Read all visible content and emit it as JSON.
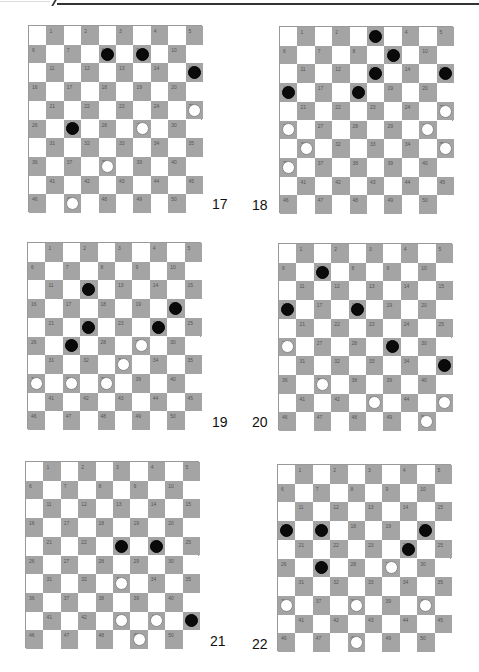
{
  "page": {
    "header_rule": true
  },
  "colors": {
    "dark_square": "#a4a4a4",
    "light_square": "#ffffff",
    "black_piece": "#0a0a0a",
    "white_piece": "#ffffff"
  },
  "boards": [
    {
      "id": "17",
      "label": "17",
      "x": 28,
      "y": 25,
      "label_x": 212,
      "label_y": 196,
      "black": [
        [
          1,
          4
        ],
        [
          1,
          6
        ],
        [
          2,
          9
        ],
        [
          5,
          2
        ]
      ],
      "white": [
        [
          4,
          9
        ],
        [
          5,
          6
        ],
        [
          7,
          4
        ],
        [
          9,
          2
        ]
      ]
    },
    {
      "id": "18",
      "label": "18",
      "x": 279,
      "y": 26,
      "label_x": 252,
      "label_y": 197,
      "black": [
        [
          0,
          5
        ],
        [
          1,
          6
        ],
        [
          2,
          5
        ],
        [
          2,
          9
        ],
        [
          3,
          0
        ],
        [
          3,
          4
        ]
      ],
      "white": [
        [
          4,
          9
        ],
        [
          5,
          0
        ],
        [
          5,
          8
        ],
        [
          6,
          1
        ],
        [
          6,
          9
        ],
        [
          7,
          0
        ]
      ]
    },
    {
      "id": "19",
      "label": "19",
      "x": 27,
      "y": 242,
      "label_x": 212,
      "label_y": 414,
      "black": [
        [
          2,
          3
        ],
        [
          3,
          8
        ],
        [
          4,
          3
        ],
        [
          4,
          7
        ],
        [
          5,
          2
        ]
      ],
      "white": [
        [
          5,
          6
        ],
        [
          6,
          5
        ],
        [
          7,
          0
        ],
        [
          7,
          2
        ],
        [
          7,
          4
        ]
      ]
    },
    {
      "id": "20",
      "label": "20",
      "x": 278,
      "y": 243,
      "label_x": 252,
      "label_y": 414,
      "black": [
        [
          1,
          2
        ],
        [
          3,
          0
        ],
        [
          3,
          4
        ],
        [
          5,
          6
        ],
        [
          6,
          9
        ]
      ],
      "white": [
        [
          5,
          0
        ],
        [
          7,
          2
        ],
        [
          8,
          5
        ],
        [
          8,
          9
        ],
        [
          9,
          8
        ]
      ]
    },
    {
      "id": "21",
      "label": "21",
      "x": 25,
      "y": 461,
      "label_x": 210,
      "label_y": 633,
      "black": [
        [
          4,
          5
        ],
        [
          4,
          7
        ],
        [
          8,
          9
        ]
      ],
      "white": [
        [
          6,
          5
        ],
        [
          8,
          5
        ],
        [
          8,
          7
        ],
        [
          9,
          6
        ]
      ]
    },
    {
      "id": "22",
      "label": "22",
      "x": 277,
      "y": 464,
      "label_x": 252,
      "label_y": 636,
      "black": [
        [
          3,
          0
        ],
        [
          3,
          2
        ],
        [
          3,
          8
        ],
        [
          4,
          7
        ],
        [
          5,
          2
        ]
      ],
      "white": [
        [
          5,
          6
        ],
        [
          7,
          0
        ],
        [
          7,
          4
        ],
        [
          7,
          8
        ],
        [
          9,
          4
        ]
      ]
    }
  ],
  "square_numbers": "1-50 on dark squares, reading left to right, top to bottom"
}
